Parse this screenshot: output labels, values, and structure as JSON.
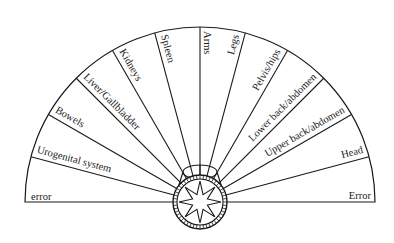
{
  "diagram": {
    "type": "semicircular-pendulum-chart",
    "center": {
      "x": 200,
      "y": 202
    },
    "radius": 175,
    "sector_angle_deg": 15,
    "colors": {
      "stroke": "#1a1a1a",
      "background": "#ffffff"
    },
    "left_labels": [
      {
        "text": "error",
        "angle": 180
      },
      {
        "text": "Urogenital system",
        "angle": 165
      },
      {
        "text": "Bowels",
        "angle": 150
      },
      {
        "text": "Liver/Gallbladder",
        "angle": 135
      },
      {
        "text": "Kidneys",
        "angle": 120
      },
      {
        "text": "Spleen",
        "angle": 105
      }
    ],
    "right_labels": [
      {
        "text": "Arms",
        "angle": 90
      },
      {
        "text": "Legs",
        "angle": 75
      },
      {
        "text": "Pelvis/hips",
        "angle": 60
      },
      {
        "text": "Lower back/abdomen",
        "angle": 45
      },
      {
        "text": "Upper back/abdomen",
        "angle": 30
      },
      {
        "text": "Head",
        "angle": 15
      },
      {
        "text": "Error",
        "angle": 0
      }
    ],
    "pivot": {
      "icon": "compass-star-icon",
      "star_points": 8,
      "ring_radius": 27,
      "ellipse": {
        "cx": 200,
        "cy": 172,
        "rx": 17,
        "ry": 7
      }
    }
  }
}
